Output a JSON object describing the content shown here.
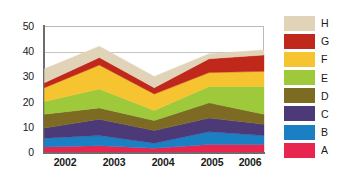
{
  "chart_data": {
    "type": "area",
    "stacked": true,
    "title": "",
    "xlabel": "",
    "ylabel": "",
    "categories": [
      "2002",
      "2003",
      "2004",
      "2005",
      "2006"
    ],
    "x": [
      2002,
      2003,
      2004,
      2005,
      2006
    ],
    "ylim": [
      0,
      50
    ],
    "yticks": [
      0,
      10,
      20,
      30,
      40,
      50
    ],
    "ytick_labels": [
      "0",
      "10",
      "20",
      "30",
      "40",
      "50"
    ],
    "grid": true,
    "legend_position": "right",
    "series": [
      {
        "name": "A",
        "color": "#e8254f",
        "values": [
          2.0,
          2.5,
          1.5,
          3.0,
          3.0
        ]
      },
      {
        "name": "B",
        "color": "#1b7fc4",
        "values": [
          3.5,
          4.0,
          2.0,
          5.0,
          3.5
        ]
      },
      {
        "name": "C",
        "color": "#4b3a77",
        "values": [
          4.0,
          6.5,
          5.0,
          5.5,
          4.5
        ]
      },
      {
        "name": "D",
        "color": "#7d6b24",
        "values": [
          5.5,
          4.5,
          4.0,
          6.0,
          4.0
        ]
      },
      {
        "name": "E",
        "color": "#9dc93b",
        "values": [
          5.0,
          7.5,
          4.0,
          6.5,
          11.0
        ]
      },
      {
        "name": "F",
        "color": "#f6c431",
        "values": [
          5.5,
          9.5,
          6.5,
          5.5,
          6.0
        ]
      },
      {
        "name": "G",
        "color": "#c0281c",
        "values": [
          2.0,
          3.0,
          2.5,
          5.5,
          6.5
        ]
      },
      {
        "name": "H",
        "color": "#e0d3b8",
        "values": [
          5.5,
          4.5,
          4.5,
          2.0,
          2.0
        ]
      }
    ],
    "totals": [
      33.0,
      42.0,
      30.0,
      39.0,
      40.5
    ],
    "legend_entries": [
      "H",
      "G",
      "F",
      "E",
      "D",
      "C",
      "B",
      "A"
    ]
  },
  "axis": {
    "y_labels": [
      "50",
      "40",
      "30",
      "20",
      "10",
      "0"
    ],
    "x_labels": [
      "2002",
      "2003",
      "2004",
      "2005",
      "2006"
    ]
  },
  "legend": {
    "items": [
      {
        "label": "H",
        "color": "#e0d3b8"
      },
      {
        "label": "G",
        "color": "#c0281c"
      },
      {
        "label": "F",
        "color": "#f6c431"
      },
      {
        "label": "E",
        "color": "#9dc93b"
      },
      {
        "label": "D",
        "color": "#7d6b24"
      },
      {
        "label": "C",
        "color": "#4b3a77"
      },
      {
        "label": "B",
        "color": "#1b7fc4"
      },
      {
        "label": "A",
        "color": "#e8254f"
      }
    ]
  }
}
